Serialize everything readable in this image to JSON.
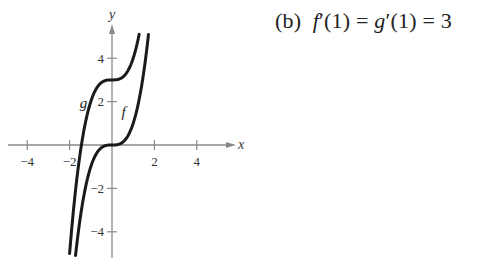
{
  "chart_data": {
    "type": "line",
    "title": "",
    "xlabel": "x",
    "ylabel": "y",
    "xlim": [
      -5.2,
      5.5
    ],
    "ylim": [
      -5.2,
      5.5
    ],
    "grid": false,
    "xticks": [
      -4,
      -2,
      2,
      4
    ],
    "yticks": [
      -4,
      -2,
      2,
      4
    ],
    "xtick_labels": [
      "−4",
      "−2",
      "2",
      "4"
    ],
    "ytick_labels": [
      "4",
      "2",
      "−2",
      "−4"
    ],
    "series": [
      {
        "name": "f",
        "expression": "x^3",
        "x": [
          -1.71,
          -1.5,
          -1,
          -0.5,
          0,
          0.5,
          1,
          1.5,
          1.71
        ],
        "values": [
          -5,
          -3.375,
          -1,
          -0.125,
          0,
          0.125,
          1,
          3.375,
          5
        ]
      },
      {
        "name": "g",
        "expression": "x^3 + 3",
        "x": [
          -2,
          -1.5,
          -1,
          -0.5,
          0,
          0.5,
          1,
          1.26
        ],
        "values": [
          -5,
          -0.375,
          2,
          2.875,
          3,
          3.125,
          4,
          5
        ]
      }
    ],
    "annotations": [
      {
        "text": "f",
        "x": 0.55,
        "y": 1.3
      },
      {
        "text": "g",
        "x": -1.35,
        "y": 1.7
      }
    ]
  },
  "caption": {
    "part": "(b)",
    "f": "f",
    "prime_one_a": "′(1) = ",
    "g": "g",
    "prime_one_b": "′(1) = 3"
  }
}
